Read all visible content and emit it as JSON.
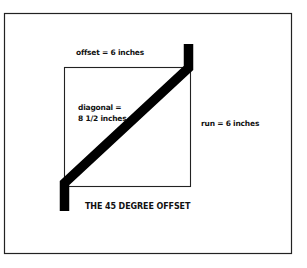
{
  "figure": {
    "caption": "THE 45 DEGREE OFFSET",
    "labels": {
      "offset": "offset = 6 inches",
      "diagonal_line1": "diagonal =",
      "diagonal_line2": "8 1/2 inches",
      "run": "run = 6 inches"
    },
    "colors": {
      "background": "#ffffff",
      "stroke": "#111111",
      "pipe": "#000000"
    }
  }
}
